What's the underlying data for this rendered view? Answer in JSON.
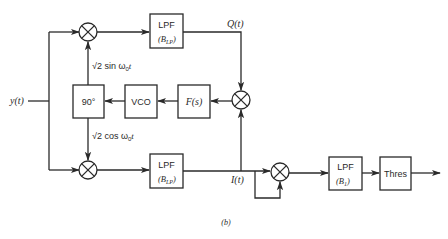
{
  "figure": {
    "caption": "(b)",
    "input_label": "y(t)",
    "blocks": {
      "lpf_top": {
        "title": "LPF",
        "param": "(B",
        "param_sub": "LP",
        "param_close": ")"
      },
      "lpf_bottom": {
        "title": "LPF",
        "param": "(B",
        "param_sub": "LP",
        "param_close": ")"
      },
      "phase_shift": {
        "label": "90°"
      },
      "vco": {
        "label": "VCO"
      },
      "loop_filter": {
        "label": "F(s)"
      },
      "lpf_b1": {
        "title": "LPF",
        "param": "(B",
        "param_sub": "1",
        "param_close": ")"
      },
      "threshold": {
        "label": "Thres"
      }
    },
    "signals": {
      "q": "Q(t)",
      "i": "I(t)",
      "sin_ref": {
        "root": "√2",
        "text": " sin ω",
        "sub": "0",
        "tail": "t"
      },
      "cos_ref": {
        "root": "√2",
        "text": " cos ω",
        "sub": "0",
        "tail": "t"
      }
    },
    "colors": {
      "stroke": "#2a2a2a",
      "background": "#ffffff"
    }
  }
}
